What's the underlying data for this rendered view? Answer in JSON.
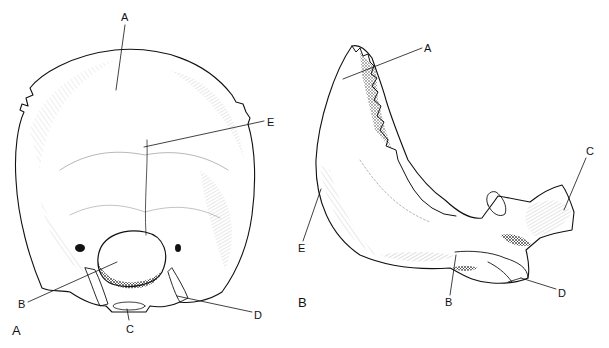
{
  "figure": {
    "panels": [
      {
        "id": "A",
        "panel_label": "A",
        "labels": [
          {
            "text": "A"
          },
          {
            "text": "E"
          },
          {
            "text": "B"
          },
          {
            "text": "C"
          },
          {
            "text": "D"
          }
        ]
      },
      {
        "id": "B",
        "panel_label": "B",
        "labels": [
          {
            "text": "A"
          },
          {
            "text": "C"
          },
          {
            "text": "E"
          },
          {
            "text": "B"
          },
          {
            "text": "D"
          }
        ]
      }
    ],
    "colors": {
      "ink": "#111111",
      "background": "#ffffff"
    }
  }
}
